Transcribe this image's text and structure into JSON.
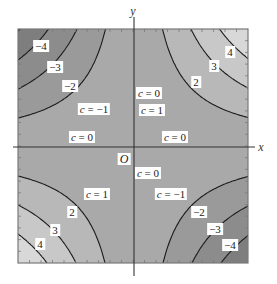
{
  "figure": {
    "function": "f(x, y) = xy",
    "axes": {
      "x_label": "x",
      "y_label": "y",
      "origin_label": "O"
    },
    "colors": {
      "frame": "#7a7a7a",
      "curve": "#1a1a1a",
      "axis": "#333333",
      "level_0": "#a9a9a9",
      "level_pos_1": "#b8b8b8",
      "level_pos_2": "#c8c8c8",
      "level_pos_3": "#d8d8d8",
      "level_pos_4": "#e9e9e9",
      "level_neg_1": "#9a9a9a",
      "level_neg_2": "#8c8c8c",
      "level_neg_3": "#7e7e7e",
      "level_neg_4": "#707070"
    },
    "levels": [
      -4,
      -3,
      -2,
      -1,
      0,
      1,
      2,
      3,
      4
    ],
    "labels": {
      "q2_m4": "−4",
      "q2_m3": "−3",
      "q2_m2": "−2",
      "q2_m1": "c = −1",
      "q2_c0": "c = 0",
      "q1_c0_upper": "c = 0",
      "q1_p1": "c = 1",
      "q1_p2": "2",
      "q1_p3": "3",
      "q1_p4": "4",
      "q1_c0_lower": "c = 0",
      "q3_p1": "c = 1",
      "q3_p2": "2",
      "q3_p3": "3",
      "q3_p4": "4",
      "q4_c0": "c = 0",
      "q4_m1": "c = −1",
      "q4_m2": "−2",
      "q4_m3": "−3",
      "q4_m4": "−4"
    }
  }
}
